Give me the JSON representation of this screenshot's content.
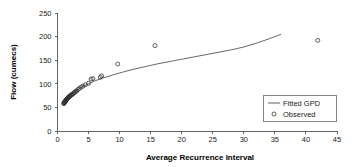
{
  "chart_data": {
    "type": "scatter",
    "title": "",
    "xlabel": "Average Recurrence Interval",
    "ylabel": "Flow (cumecs)",
    "xlim": [
      0,
      45
    ],
    "ylim": [
      0,
      250
    ],
    "xticks": [
      0,
      5,
      10,
      15,
      20,
      25,
      30,
      35,
      40,
      45
    ],
    "yticks": [
      0,
      50,
      100,
      150,
      200,
      250
    ],
    "grid": false,
    "legend_position": "lower right",
    "series": [
      {
        "name": "Fitted GPD",
        "type": "line",
        "points": [
          [
            1.0,
            58
          ],
          [
            1.2,
            62
          ],
          [
            1.4,
            66
          ],
          [
            1.6,
            69
          ],
          [
            1.8,
            72
          ],
          [
            2.0,
            75
          ],
          [
            2.5,
            81
          ],
          [
            3.0,
            86
          ],
          [
            3.5,
            90
          ],
          [
            4.0,
            94
          ],
          [
            5.0,
            100
          ],
          [
            6.0,
            106
          ],
          [
            7.0,
            111
          ],
          [
            8.0,
            115
          ],
          [
            9.0,
            119
          ],
          [
            10.0,
            123
          ],
          [
            12.0,
            130
          ],
          [
            14.0,
            136
          ],
          [
            16.0,
            142
          ],
          [
            18.0,
            147
          ],
          [
            20.0,
            152
          ],
          [
            22.0,
            157
          ],
          [
            24.0,
            162
          ],
          [
            26.0,
            167
          ],
          [
            28.0,
            172
          ],
          [
            30.0,
            178
          ],
          [
            32.0,
            186
          ],
          [
            34.0,
            195
          ],
          [
            36.0,
            205
          ]
        ]
      },
      {
        "name": "Observed",
        "type": "scatter",
        "marker": "open-circle",
        "points": [
          [
            1.02,
            58
          ],
          [
            1.05,
            59
          ],
          [
            1.08,
            60
          ],
          [
            1.11,
            60
          ],
          [
            1.15,
            61
          ],
          [
            1.19,
            62
          ],
          [
            1.23,
            63
          ],
          [
            1.27,
            63
          ],
          [
            1.32,
            64
          ],
          [
            1.37,
            65
          ],
          [
            1.42,
            66
          ],
          [
            1.48,
            67
          ],
          [
            1.54,
            68
          ],
          [
            1.6,
            69
          ],
          [
            1.67,
            70
          ],
          [
            1.74,
            71
          ],
          [
            1.82,
            72
          ],
          [
            1.9,
            73
          ],
          [
            1.99,
            74
          ],
          [
            2.08,
            75
          ],
          [
            2.18,
            76
          ],
          [
            2.29,
            77
          ],
          [
            2.4,
            78
          ],
          [
            2.52,
            79
          ],
          [
            2.65,
            81
          ],
          [
            2.79,
            82
          ],
          [
            2.94,
            84
          ],
          [
            3.1,
            85
          ],
          [
            3.3,
            88
          ],
          [
            3.5,
            90
          ],
          [
            3.8,
            93
          ],
          [
            4.1,
            95
          ],
          [
            4.5,
            98
          ],
          [
            5.0,
            101
          ],
          [
            5.4,
            110
          ],
          [
            5.7,
            111
          ],
          [
            6.9,
            114
          ],
          [
            7.1,
            117
          ],
          [
            9.7,
            142
          ],
          [
            15.7,
            181
          ],
          [
            41.9,
            192
          ]
        ]
      }
    ]
  },
  "legend": {
    "entries": [
      {
        "label": "Fitted GPD",
        "marker": "line"
      },
      {
        "label": "Observed",
        "marker": "open-circle"
      }
    ]
  },
  "colors": {
    "curve": "#4a4a5a",
    "marker": "#333333",
    "axis": "#555555",
    "background": "#ffffff"
  }
}
